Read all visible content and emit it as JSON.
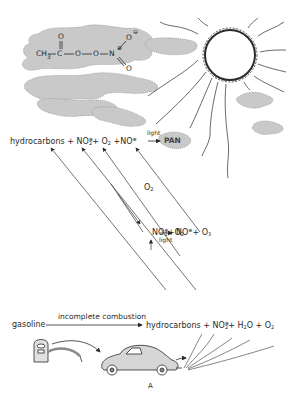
{
  "figure": {
    "caption": "A",
    "colors": {
      "line": "#3a3a3a",
      "smog": "#c9c9c9",
      "background": "#ffffff"
    }
  },
  "pan_molecule": {
    "ch3": "CH",
    "ch3_sub": "3",
    "c": "C",
    "o1": "O",
    "o2": "O",
    "n": "N",
    "n_charge": "⊕",
    "o_top": "O",
    "o_top_charge": "⊖",
    "o_carbonyl": "O",
    "o_bottom": "O"
  },
  "top_equation": {
    "hydrocarbons": "hydrocarbons",
    "plus1": "+",
    "no2": "NO",
    "no2_sub": "2",
    "no2_charge": "⊕",
    "plus2": "+",
    "o2": "O",
    "o2_sub": "2",
    "plus3": "+",
    "no": "NO",
    "no_charge": "⊕",
    "arrow_label": "light",
    "product": "PAN"
  },
  "middle_equation": {
    "o2_label": "O",
    "o2_label_sub": "2",
    "no2": "NO",
    "no2_sub": "2",
    "no2_charge": "⊕",
    "plus1": "+",
    "o2": "O",
    "o2_sub": "2",
    "arrow_label": "light",
    "no": "NO",
    "no_charge": "⊕",
    "plus2": "+",
    "o3": "O",
    "o3_sub": "3"
  },
  "bottom_equation": {
    "gasoline": "gasoline",
    "arrow_label": "incomplete combustion",
    "hydrocarbons": "hydrocarbons",
    "plus1": "+",
    "no2": "NO",
    "no2_sub": "2",
    "no2_charge": "⊕",
    "plus2": "+",
    "h2o_h": "H",
    "h2o_sub": "2",
    "h2o_o": "O",
    "plus3": "+",
    "o2": "O",
    "o2_sub": "2"
  },
  "illustrations": [
    "sun",
    "smog-cloud",
    "gas-pump",
    "car",
    "exhaust-fumes"
  ]
}
